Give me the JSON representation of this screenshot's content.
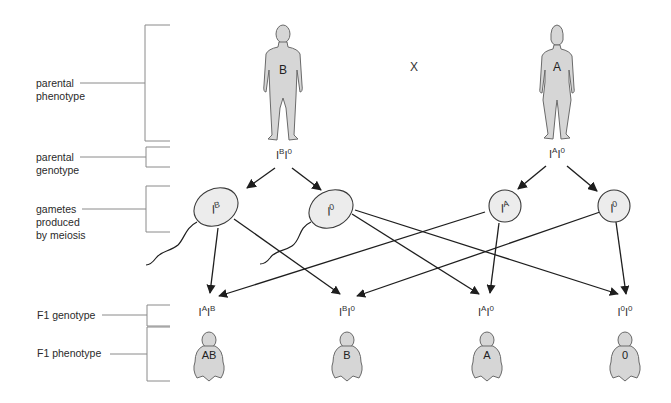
{
  "row_labels": [
    {
      "id": "parental-phenotype",
      "lines": [
        "parental",
        "phenotype"
      ]
    },
    {
      "id": "parental-genotype",
      "lines": [
        "parental",
        "genotype"
      ]
    },
    {
      "id": "gametes",
      "lines": [
        "gametes",
        "produced",
        "by meiosis"
      ]
    },
    {
      "id": "f1-genotype",
      "lines": [
        "F1 genotype"
      ]
    },
    {
      "id": "f1-phenotype",
      "lines": [
        "F1 phenotype"
      ]
    }
  ],
  "cross_symbol": "X",
  "parents": {
    "father": {
      "phenotype": "B",
      "genotype": {
        "base1": "I",
        "sup1": "B",
        "base2": "I",
        "sup2": "0"
      }
    },
    "mother": {
      "phenotype": "A",
      "genotype": {
        "base1": "I",
        "sup1": "A",
        "base2": "I",
        "sup2": "0"
      }
    }
  },
  "gametes": [
    {
      "base": "I",
      "sup": "B",
      "type": "sperm"
    },
    {
      "base": "I",
      "sup": "0",
      "type": "sperm"
    },
    {
      "base": "I",
      "sup": "A",
      "type": "egg"
    },
    {
      "base": "I",
      "sup": "0",
      "type": "egg"
    }
  ],
  "offspring": [
    {
      "genotype": {
        "base1": "I",
        "sup1": "A",
        "base2": "I",
        "sup2": "B"
      },
      "phenotype": "AB"
    },
    {
      "genotype": {
        "base1": "I",
        "sup1": "B",
        "base2": "I",
        "sup2": "0"
      },
      "phenotype": "B"
    },
    {
      "genotype": {
        "base1": "I",
        "sup1": "A",
        "base2": "I",
        "sup2": "0"
      },
      "phenotype": "A"
    },
    {
      "genotype": {
        "base1": "I",
        "sup1": "0",
        "base2": "I",
        "sup2": "0"
      },
      "phenotype": "0"
    }
  ],
  "colors": {
    "figure_fill": "#d6d6d6",
    "figure_stroke": "#6a6a6a",
    "gamete_fill": "#ececec",
    "line": "#1e1e1e",
    "bracket": "#8a8a8a"
  }
}
